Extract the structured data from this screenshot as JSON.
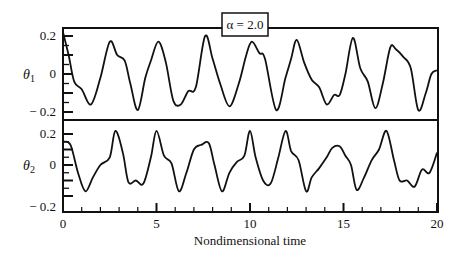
{
  "chart_data": {
    "type": "line",
    "title": "",
    "legend": "α = 2.0",
    "xlabel": "Nondimensional time",
    "xlim": [
      0,
      20
    ],
    "x_ticks": [
      "0",
      "5",
      "10",
      "15",
      "20"
    ],
    "grid": false,
    "legend_position": "top-center",
    "panels": [
      {
        "ylabel": "θ1",
        "ylim": [
          -0.2,
          0.2
        ],
        "y_ticks": [
          "0.2",
          "0",
          "− 0.2"
        ],
        "series": [
          {
            "name": "theta1",
            "x": [
              0,
              0.3,
              0.6,
              1.0,
              1.5,
              2.0,
              2.5,
              2.9,
              3.3,
              3.6,
              4.0,
              4.4,
              4.7,
              5.1,
              5.5,
              5.9,
              6.3,
              6.7,
              7.1,
              7.6,
              8.0,
              8.4,
              8.9,
              9.4,
              9.8,
              10.1,
              10.5,
              10.8,
              11.4,
              11.9,
              12.2,
              12.5,
              12.9,
              13.3,
              13.7,
              14.1,
              14.5,
              14.8,
              15.1,
              15.5,
              15.9,
              16.3,
              16.7,
              17.1,
              17.5,
              17.8,
              18.2,
              18.6,
              19.0,
              19.4,
              19.7,
              20.0
            ],
            "y": [
              0.22,
              0.1,
              -0.04,
              -0.08,
              -0.16,
              -0.02,
              0.17,
              0.1,
              0.07,
              -0.05,
              -0.19,
              -0.02,
              0.07,
              0.17,
              0.06,
              -0.14,
              -0.16,
              -0.09,
              -0.07,
              0.2,
              0.08,
              -0.05,
              -0.17,
              -0.05,
              0.1,
              0.17,
              0.11,
              0.08,
              -0.19,
              -0.02,
              0.08,
              0.18,
              0.06,
              -0.03,
              -0.07,
              -0.16,
              -0.11,
              -0.11,
              0.0,
              0.19,
              0.03,
              -0.04,
              -0.18,
              -0.05,
              0.14,
              0.13,
              0.09,
              0.03,
              -0.19,
              -0.1,
              0.0,
              0.02
            ]
          }
        ]
      },
      {
        "ylabel": "θ2",
        "ylim": [
          -0.2,
          0.2
        ],
        "y_ticks": [
          "0.2",
          "0",
          "− 0.2"
        ],
        "series": [
          {
            "name": "theta2",
            "x": [
              0,
              0.4,
              0.8,
              1.2,
              1.6,
              2.0,
              2.5,
              2.8,
              3.2,
              3.5,
              3.9,
              4.3,
              4.7,
              5.0,
              5.4,
              5.8,
              6.2,
              6.6,
              7.0,
              7.4,
              7.8,
              8.1,
              8.5,
              8.9,
              9.3,
              9.7,
              10.0,
              10.3,
              10.7,
              11.1,
              11.5,
              11.9,
              12.2,
              12.6,
              13.0,
              13.3,
              13.7,
              14.1,
              14.4,
              14.8,
              15.1,
              15.4,
              15.7,
              16.1,
              16.5,
              16.9,
              17.3,
              17.7,
              18.0,
              18.4,
              18.8,
              19.2,
              19.6,
              20.0
            ],
            "y": [
              0.15,
              0.13,
              -0.05,
              -0.17,
              -0.08,
              0.0,
              0.05,
              0.22,
              0.08,
              -0.11,
              -0.1,
              -0.12,
              0.05,
              0.22,
              0.06,
              0.01,
              -0.17,
              -0.05,
              0.1,
              0.13,
              0.14,
              0.0,
              -0.17,
              -0.05,
              0.02,
              0.06,
              0.22,
              0.05,
              -0.1,
              -0.12,
              0.04,
              0.22,
              0.09,
              0.03,
              -0.17,
              -0.08,
              -0.02,
              0.05,
              0.11,
              0.12,
              0.06,
              0.0,
              -0.16,
              -0.08,
              0.03,
              0.1,
              0.22,
              0.03,
              -0.1,
              -0.1,
              -0.14,
              -0.03,
              -0.05,
              0.08
            ]
          }
        ]
      }
    ]
  }
}
